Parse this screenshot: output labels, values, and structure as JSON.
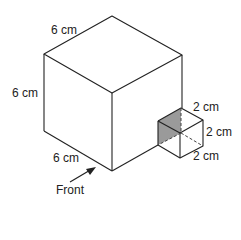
{
  "diagram": {
    "type": "3d-solid",
    "big_cube": {
      "top_edge_label": "6 cm",
      "left_edge_label": "6 cm",
      "bottom_edge_label": "6 cm"
    },
    "small_cube": {
      "top_edge_label": "2 cm",
      "right_edge_label": "2 cm",
      "bottom_edge_label": "2 cm",
      "shaded_face_color": "#9a9a9a"
    },
    "arrow_label": "Front"
  }
}
